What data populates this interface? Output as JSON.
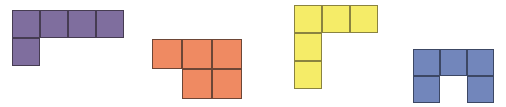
{
  "figure": {
    "title": "",
    "background_color": "#ffffff",
    "width": 506,
    "height": 107
  },
  "shapes": [
    {
      "id": "purple-pentomino",
      "name": "J-pentomino",
      "color": "#7f6e9e",
      "border_color": "#463c52",
      "origin_x": 12,
      "origin_y": 10,
      "cell_size": 28,
      "cells": [
        {
          "col": 0,
          "row": 0
        },
        {
          "col": 1,
          "row": 0
        },
        {
          "col": 2,
          "row": 0
        },
        {
          "col": 3,
          "row": 0
        },
        {
          "col": 0,
          "row": 1
        }
      ],
      "cell_count": 5
    },
    {
      "id": "orange-pentomino",
      "name": "P-pentomino",
      "color": "#ef8a62",
      "border_color": "#6d4636",
      "origin_x": 152,
      "origin_y": 39,
      "cell_size": 30,
      "cells": [
        {
          "col": 0,
          "row": 0
        },
        {
          "col": 1,
          "row": 0
        },
        {
          "col": 2,
          "row": 0
        },
        {
          "col": 1,
          "row": 1
        },
        {
          "col": 2,
          "row": 1
        }
      ],
      "cell_count": 5
    },
    {
      "id": "yellow-pentomino",
      "name": "V-pentomino",
      "color": "#f5ec68",
      "border_color": "#8a8340",
      "origin_x": 294,
      "origin_y": 5,
      "cell_size": 28,
      "cells": [
        {
          "col": 0,
          "row": 0
        },
        {
          "col": 1,
          "row": 0
        },
        {
          "col": 2,
          "row": 0
        },
        {
          "col": 0,
          "row": 1
        },
        {
          "col": 0,
          "row": 2
        }
      ],
      "cell_count": 5
    },
    {
      "id": "blue-pentomino",
      "name": "U-pentomino",
      "color": "#7286bb",
      "border_color": "#3c4764",
      "origin_x": 413,
      "origin_y": 49,
      "cell_size": 27,
      "cells": [
        {
          "col": 0,
          "row": 0
        },
        {
          "col": 1,
          "row": 0
        },
        {
          "col": 2,
          "row": 0
        },
        {
          "col": 0,
          "row": 1
        },
        {
          "col": 2,
          "row": 1
        }
      ],
      "cell_count": 5
    }
  ]
}
